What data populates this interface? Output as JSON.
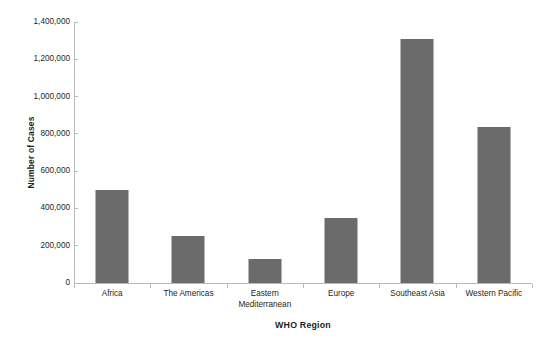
{
  "chart_data": {
    "type": "bar",
    "title": "",
    "subtitle": "",
    "xlabel": "WHO Region",
    "ylabel": "Number of Cases",
    "categories": [
      "Africa",
      "The Americas",
      "Eastern Mediterranean",
      "Europe",
      "Southeast Asia",
      "Western Pacific"
    ],
    "category_lines": [
      [
        "Africa"
      ],
      [
        "The Americas"
      ],
      [
        "Eastern",
        "Mediterranean"
      ],
      [
        "Europe"
      ],
      [
        "Southeast Asia"
      ],
      [
        "Western Pacific"
      ]
    ],
    "values": [
      500000,
      250000,
      130000,
      350000,
      1310000,
      835000
    ],
    "ylim": [
      0,
      1400000
    ],
    "yticks": [
      0,
      200000,
      400000,
      600000,
      800000,
      1000000,
      1200000,
      1400000
    ],
    "ytick_labels": [
      "0",
      "200,000",
      "400,000",
      "600,000",
      "800,000",
      "1,000,000",
      "1,200,000",
      "1,400,000"
    ],
    "grid": false,
    "legend": null,
    "legend_position": "none",
    "bar_color": "#6b6b6b",
    "axis_color": "#b9b9b9",
    "text_color": "#231f20",
    "background_color": "#ffffff"
  }
}
